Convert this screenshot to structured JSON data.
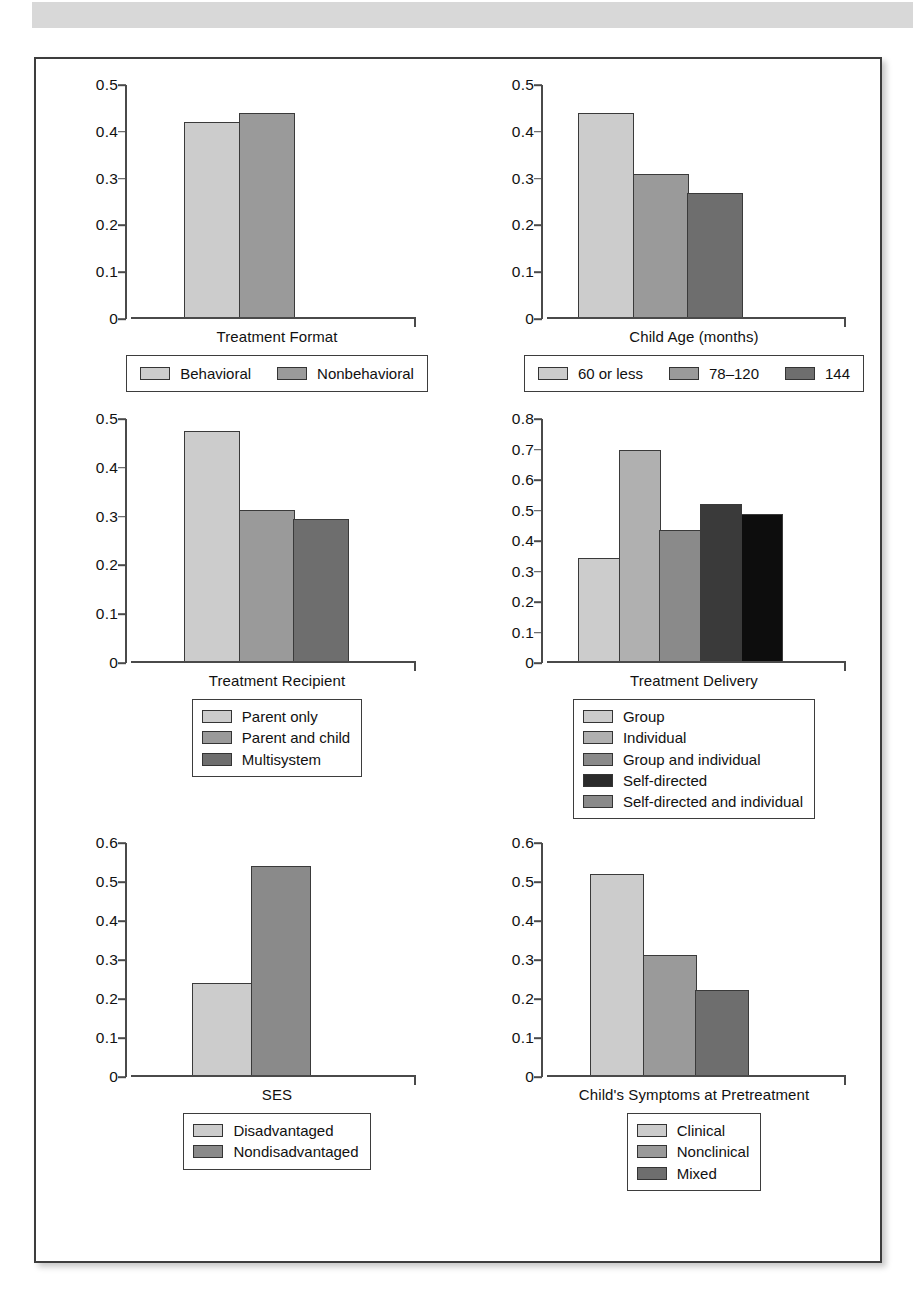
{
  "page": {
    "header_band": "scanned-page-header-band",
    "figure_border_color": "#3d3d3d"
  },
  "palette": {
    "light": "#cccccc",
    "light_mid": "#b0b0b0",
    "mid": "#9a9a9a",
    "mid_dark": "#8a8a8a",
    "dark": "#4a4a4a",
    "darker": "#3a3a3a",
    "black": "#0d0d0d",
    "outline": "#343434"
  },
  "chart_data": [
    {
      "id": "treatment-format",
      "type": "bar",
      "title": "Treatment Format",
      "xlabel": "Treatment Format",
      "ylabel": "",
      "ylim": [
        0,
        0.5
      ],
      "yticks": [
        "0.5",
        "0.4",
        "0.3",
        "0.2",
        "0.1",
        "0"
      ],
      "ytick_values": [
        0.5,
        0.4,
        0.3,
        0.2,
        0.1,
        0
      ],
      "grid": false,
      "legend_position": "below-horizontal",
      "categories": [
        "Behavioral",
        "Nonbehavioral"
      ],
      "values": [
        0.42,
        0.44
      ],
      "colors": [
        "#cccccc",
        "#9a9a9a"
      ]
    },
    {
      "id": "child-age",
      "type": "bar",
      "title": "Child Age (months)",
      "xlabel": "Child Age (months)",
      "ylabel": "",
      "ylim": [
        0,
        0.5
      ],
      "yticks": [
        "0.5",
        "0.4",
        "0.3",
        "0.2",
        "0.1",
        "0"
      ],
      "ytick_values": [
        0.5,
        0.4,
        0.3,
        0.2,
        0.1,
        0
      ],
      "grid": false,
      "legend_position": "below-horizontal",
      "categories": [
        "60 or less",
        "78–120",
        "144"
      ],
      "values": [
        0.44,
        0.31,
        0.27
      ],
      "colors": [
        "#cccccc",
        "#9a9a9a",
        "#6e6e6e"
      ]
    },
    {
      "id": "treatment-recipient",
      "type": "bar",
      "title": "Treatment Recipient",
      "xlabel": "Treatment Recipient",
      "ylabel": "",
      "ylim": [
        0,
        0.5
      ],
      "yticks": [
        "0.5",
        "0.4",
        "0.3",
        "0.2",
        "0.1",
        "0"
      ],
      "ytick_values": [
        0.5,
        0.4,
        0.3,
        0.2,
        0.1,
        0
      ],
      "grid": false,
      "legend_position": "below-vertical",
      "categories": [
        "Parent only",
        "Parent and child",
        "Multisystem"
      ],
      "values": [
        0.475,
        0.313,
        0.295
      ],
      "colors": [
        "#cccccc",
        "#9a9a9a",
        "#6e6e6e"
      ]
    },
    {
      "id": "treatment-delivery",
      "type": "bar",
      "title": "Treatment Delivery",
      "xlabel": "Treatment Delivery",
      "ylabel": "",
      "ylim": [
        0,
        0.8
      ],
      "yticks": [
        "0.8",
        "0.7",
        "0.6",
        "0.5",
        "0.4",
        "0.3",
        "0.2",
        "0.1",
        "0"
      ],
      "ytick_values": [
        0.8,
        0.7,
        0.6,
        0.5,
        0.4,
        0.3,
        0.2,
        0.1,
        0
      ],
      "grid": false,
      "legend_position": "below-vertical",
      "categories": [
        "Group",
        "Individual",
        "Group and individual",
        "Self-directed",
        "Self-directed and individual"
      ],
      "values": [
        0.343,
        0.698,
        0.437,
        0.52,
        0.49
      ],
      "colors": [
        "#cccccc",
        "#b0b0b0",
        "#8a8a8a",
        "#3a3a3a",
        "#0d0d0d"
      ],
      "legend_colors": [
        "#cccccc",
        "#b0b0b0",
        "#8a8a8a",
        "#2b2b2b",
        "#8a8a8a"
      ]
    },
    {
      "id": "ses",
      "type": "bar",
      "title": "SES",
      "xlabel": "SES",
      "ylabel": "",
      "ylim": [
        0,
        0.6
      ],
      "yticks": [
        "0.6",
        "0.5",
        "0.4",
        "0.3",
        "0.2",
        "0.1",
        "0"
      ],
      "ytick_values": [
        0.6,
        0.5,
        0.4,
        0.3,
        0.2,
        0.1,
        0
      ],
      "grid": false,
      "legend_position": "below-vertical",
      "categories": [
        "Disadvantaged",
        "Nondisadvantaged"
      ],
      "values": [
        0.24,
        0.54
      ],
      "colors": [
        "#cccccc",
        "#8a8a8a"
      ]
    },
    {
      "id": "child-symptoms",
      "type": "bar",
      "title": "Child's Symptoms at Pretreatment",
      "xlabel": "Child's Symptoms at Pretreatment",
      "ylabel": "",
      "ylim": [
        0,
        0.6
      ],
      "yticks": [
        "0.6",
        "0.5",
        "0.4",
        "0.3",
        "0.2",
        "0.1",
        "0"
      ],
      "ytick_values": [
        0.6,
        0.5,
        0.4,
        0.3,
        0.2,
        0.1,
        0
      ],
      "grid": false,
      "legend_position": "below-vertical",
      "categories": [
        "Clinical",
        "Nonclinical",
        "Mixed"
      ],
      "values": [
        0.52,
        0.312,
        0.224
      ],
      "colors": [
        "#cccccc",
        "#9a9a9a",
        "#6e6e6e"
      ]
    }
  ]
}
